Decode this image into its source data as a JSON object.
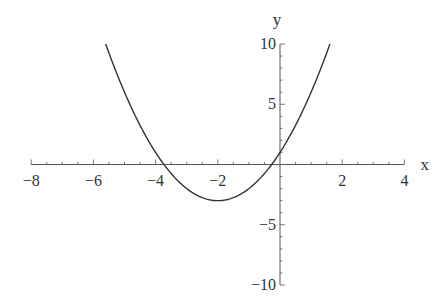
{
  "chart_data": {
    "type": "line",
    "title": "",
    "function": "y = x^2 + 4x + 1",
    "xlabel": "x",
    "ylabel": "y",
    "xlim": [
      -8,
      4
    ],
    "ylim": [
      -10,
      10
    ],
    "x_ticks": [
      -8,
      -6,
      -4,
      -2,
      2,
      4
    ],
    "x_tick_labels": [
      "−8",
      "−6",
      "−4",
      "−2",
      "2",
      "4"
    ],
    "y_ticks": [
      -10,
      -5,
      5,
      10
    ],
    "y_tick_labels": [
      "−10",
      "−5",
      "5",
      "10"
    ],
    "grid": false,
    "legend": null,
    "series": [
      {
        "name": "parabola",
        "color": "#333333",
        "x_range": [
          -5.606,
          1.606
        ],
        "vertex": [
          -2,
          -3
        ],
        "roots": [
          -3.732,
          -0.268
        ],
        "y_intercept": 1,
        "points": [
          {
            "x": -5.606,
            "y": 10
          },
          {
            "x": -5,
            "y": 6
          },
          {
            "x": -4,
            "y": 1
          },
          {
            "x": -3.732,
            "y": 0
          },
          {
            "x": -3,
            "y": -2
          },
          {
            "x": -2,
            "y": -3
          },
          {
            "x": -1,
            "y": -2
          },
          {
            "x": -0.268,
            "y": 0
          },
          {
            "x": 0,
            "y": 1
          },
          {
            "x": 1,
            "y": 6
          },
          {
            "x": 1.606,
            "y": 10
          }
        ]
      }
    ]
  },
  "layout": {
    "x_origin_px": 280,
    "y_origin_px": 164.5,
    "x_px_per_unit": 31.1,
    "y_px_per_unit": 12.05,
    "axis_color": "#555555",
    "curve_color": "#333333"
  }
}
